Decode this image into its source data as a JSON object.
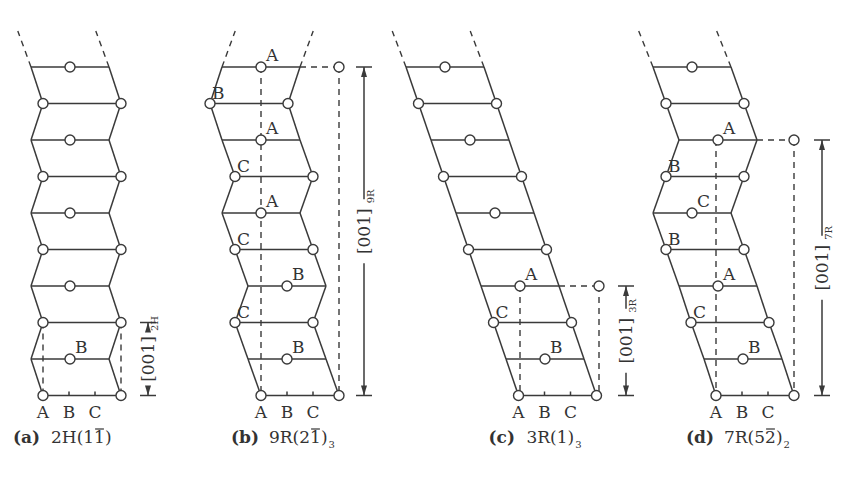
{
  "figure": {
    "type": "crystal stacking sequence diagrams",
    "row_y": [
      67,
      103.5,
      140,
      176.5,
      213,
      249.5,
      286,
      322.5,
      359,
      395.5
    ],
    "row_width": 78,
    "panels": [
      {
        "id": "a",
        "caption_letter": "(a)",
        "caption_text": "2H(1",
        "caption_bar": "1",
        "caption_close": ")",
        "caption_sub": "",
        "lefts": [
          31,
          43,
          31,
          43,
          31,
          43,
          31,
          43,
          31,
          43
        ],
        "atoms": [
          "mid",
          "ends",
          "mid",
          "ends",
          "mid",
          "ends",
          "mid",
          "ends",
          "mid",
          "ends"
        ],
        "layer_labels": [
          {
            "row": 8,
            "pos": "mid",
            "text": "B"
          }
        ],
        "cell": {
          "top_row": 7,
          "left_x": 43,
          "right_x": 121,
          "extra_atom": null
        },
        "dimension": {
          "x": 148,
          "from_row": 7,
          "to_row": 9,
          "label": "[001]",
          "sub": "2H"
        },
        "ticks": [
          "A",
          "B",
          "C"
        ]
      },
      {
        "id": "b",
        "caption_letter": "(b)",
        "caption_text": "9R(2",
        "caption_bar": "1",
        "caption_close": ")",
        "caption_sub": "3",
        "lefts": [
          222,
          210,
          222,
          235,
          222,
          235,
          248,
          235,
          248,
          261
        ],
        "atoms": [
          "mid",
          "ends",
          "mid",
          "ends",
          "mid",
          "ends",
          "mid",
          "ends",
          "mid",
          "ends"
        ],
        "layer_labels": [
          {
            "row": 0,
            "pos": "mid",
            "text": "A"
          },
          {
            "row": 1,
            "pos": "left",
            "text": "B"
          },
          {
            "row": 2,
            "pos": "mid",
            "text": "A"
          },
          {
            "row": 3,
            "pos": "left",
            "text": "C"
          },
          {
            "row": 4,
            "pos": "mid",
            "text": "A"
          },
          {
            "row": 5,
            "pos": "left",
            "text": "C"
          },
          {
            "row": 6,
            "pos": "mid",
            "text": "B"
          },
          {
            "row": 7,
            "pos": "left",
            "text": "C"
          },
          {
            "row": 8,
            "pos": "mid",
            "text": "B"
          }
        ],
        "cell": {
          "top_row": 0,
          "left_x": 261,
          "right_x": 339,
          "extra_atom": 339
        },
        "dimension": {
          "x": 364,
          "from_row": 0,
          "to_row": 9,
          "label": "[001]",
          "sub": "9R"
        },
        "ticks": [
          "A",
          "B",
          "C"
        ]
      },
      {
        "id": "c",
        "caption_letter": "(c)",
        "caption_text": "3R(1)",
        "caption_bar": "",
        "caption_close": "",
        "caption_sub": "3",
        "lefts": [
          406,
          418.5,
          431,
          443.5,
          456,
          468.5,
          481,
          493.5,
          506,
          518.5
        ],
        "atoms": [
          "mid",
          "ends",
          "mid",
          "ends",
          "mid",
          "ends",
          "mid",
          "ends",
          "mid",
          "ends"
        ],
        "layer_labels": [
          {
            "row": 6,
            "pos": "mid",
            "text": "A"
          },
          {
            "row": 7,
            "pos": "left",
            "text": "C"
          },
          {
            "row": 8,
            "pos": "mid",
            "text": "B"
          }
        ],
        "cell": {
          "top_row": 6,
          "left_x": 520,
          "right_x": 599,
          "extra_atom": 599
        },
        "dimension": {
          "x": 626,
          "from_row": 6,
          "to_row": 9,
          "label": "[001]",
          "sub": "3R"
        },
        "ticks": [
          "A",
          "B",
          "C"
        ]
      },
      {
        "id": "d",
        "caption_letter": "(d)",
        "caption_text": "7R(5",
        "caption_bar": "2",
        "caption_close": ")",
        "caption_sub": "2",
        "lefts": [
          653,
          666,
          679,
          666,
          653,
          666,
          679,
          691,
          704,
          716
        ],
        "atoms": [
          "mid",
          "ends",
          "mid",
          "ends",
          "mid",
          "ends",
          "mid",
          "ends",
          "mid",
          "ends"
        ],
        "layer_labels": [
          {
            "row": 2,
            "pos": "mid",
            "text": "A"
          },
          {
            "row": 3,
            "pos": "left",
            "text": "B"
          },
          {
            "row": 4,
            "pos": "mid",
            "text": "C"
          },
          {
            "row": 5,
            "pos": "left",
            "text": "B"
          },
          {
            "row": 6,
            "pos": "mid",
            "text": "A"
          },
          {
            "row": 7,
            "pos": "left",
            "text": "C"
          },
          {
            "row": 8,
            "pos": "mid",
            "text": "B"
          }
        ],
        "cell": {
          "top_row": 2,
          "left_x": 716,
          "right_x": 794,
          "extra_atom": 794
        },
        "dimension": {
          "x": 822,
          "from_row": 2,
          "to_row": 9,
          "label": "[001]",
          "sub": "7R"
        },
        "ticks": [
          "A",
          "B",
          "C"
        ]
      }
    ]
  }
}
